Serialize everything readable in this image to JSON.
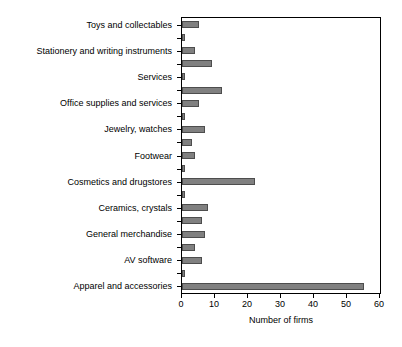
{
  "chart_data": {
    "type": "bar",
    "orientation": "horizontal",
    "title": "",
    "subtitle": "",
    "xlabel": "Number of firms",
    "ylabel": "",
    "xlim": [
      0,
      60
    ],
    "xticks": [
      0,
      10,
      20,
      30,
      40,
      50,
      60
    ],
    "xtick_labels": [
      "0",
      "10",
      "20",
      "30",
      "40",
      "50",
      "60"
    ],
    "grid": false,
    "legend": "none",
    "bar_color": "#808080",
    "bar_edge_color": "#4d4d4d",
    "axis_color": "#000000",
    "background": "#ffffff",
    "categories": [
      "Toys and collectables",
      "Stationery and writing instruments",
      "Services",
      "Office supplies and services",
      "Jewelry, watches",
      "Footwear",
      "Cosmetics and drugstores",
      "Ceramics, crystals",
      "General merchandise",
      "AV software",
      "Apparel and accessories"
    ],
    "series": [
      {
        "name": "Labeled category bar",
        "values": [
          5,
          4,
          1,
          5,
          7,
          4,
          22,
          8,
          7,
          6,
          55
        ]
      },
      {
        "name": "Secondary bar",
        "values": [
          1,
          9,
          12,
          1,
          3,
          1,
          1,
          6,
          4,
          1,
          null
        ]
      }
    ],
    "bars_top_to_bottom": [
      {
        "category": "Toys and collectables",
        "value": 5,
        "labeled": true
      },
      {
        "category": "",
        "value": 1,
        "labeled": false
      },
      {
        "category": "Stationery and writing instruments",
        "value": 4,
        "labeled": true
      },
      {
        "category": "",
        "value": 9,
        "labeled": false
      },
      {
        "category": "Services",
        "value": 1,
        "labeled": true
      },
      {
        "category": "",
        "value": 12,
        "labeled": false
      },
      {
        "category": "Office supplies and services",
        "value": 5,
        "labeled": true
      },
      {
        "category": "",
        "value": 1,
        "labeled": false
      },
      {
        "category": "Jewelry, watches",
        "value": 7,
        "labeled": true
      },
      {
        "category": "",
        "value": 3,
        "labeled": false
      },
      {
        "category": "Footwear",
        "value": 4,
        "labeled": true
      },
      {
        "category": "",
        "value": 1,
        "labeled": false
      },
      {
        "category": "Cosmetics and drugstores",
        "value": 22,
        "labeled": true
      },
      {
        "category": "",
        "value": 1,
        "labeled": false
      },
      {
        "category": "Ceramics, crystals",
        "value": 8,
        "labeled": true
      },
      {
        "category": "",
        "value": 6,
        "labeled": false
      },
      {
        "category": "General merchandise",
        "value": 7,
        "labeled": true
      },
      {
        "category": "",
        "value": 4,
        "labeled": false
      },
      {
        "category": "AV software",
        "value": 6,
        "labeled": true
      },
      {
        "category": "",
        "value": 1,
        "labeled": false
      },
      {
        "category": "Apparel and accessories",
        "value": 55,
        "labeled": true
      }
    ]
  }
}
